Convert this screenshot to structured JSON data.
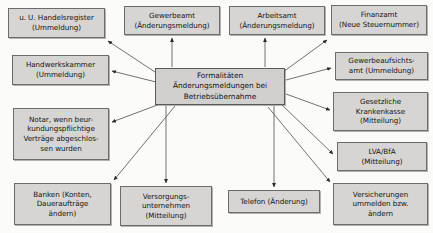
{
  "diagram": {
    "type": "radial-hub-and-spoke",
    "center": {
      "id": "center-hub",
      "name": "center-hub",
      "label": "Formalitäten\nÄnderungsmeldungen bei\nBetriebsübernahme",
      "lines": [
        "Formalitäten",
        "Änderungsmeldungen bei",
        "Betriebsübernahme"
      ],
      "box": {
        "x": 155,
        "y": 68,
        "w": 130,
        "h": 37
      }
    },
    "nodes": [
      {
        "id": "handelsregister",
        "name": "node-handelsregister",
        "lines": [
          "u. U. Handelsregister",
          "(Ummeldung)"
        ],
        "box": {
          "x": 8,
          "y": 8,
          "w": 97,
          "h": 30
        },
        "arrow": {
          "from": [
            158,
            74
          ],
          "to": [
            108,
            41
          ]
        }
      },
      {
        "id": "handwerkskammer",
        "name": "node-handwerkskammer",
        "lines": [
          "Handwerkskammer",
          "(Ummeldung)"
        ],
        "box": {
          "x": 12,
          "y": 55,
          "w": 97,
          "h": 30
        },
        "arrow": {
          "from": [
            156,
            82
          ],
          "to": [
            112,
            71
          ]
        }
      },
      {
        "id": "notar",
        "name": "node-notar",
        "lines": [
          "Notar, wenn beur-",
          "kundungspflichtige",
          "Verträge abgeschlos-",
          "sen wurden"
        ],
        "box": {
          "x": 13,
          "y": 108,
          "w": 96,
          "h": 52
        },
        "arrow": {
          "from": [
            160,
            104
          ],
          "to": [
            112,
            122
          ]
        }
      },
      {
        "id": "banken",
        "name": "node-banken",
        "lines": [
          "Banken (Konten,",
          "Daueraufträge",
          "ändern)"
        ],
        "box": {
          "x": 14,
          "y": 183,
          "w": 97,
          "h": 42
        },
        "arrow": {
          "from": [
            175,
            106
          ],
          "to": [
            114,
            180
          ]
        }
      },
      {
        "id": "gewerbeamt",
        "name": "node-gewerbeamt",
        "lines": [
          "Gewerbeamt",
          "(Änderungsmeldung)"
        ],
        "box": {
          "x": 124,
          "y": 6,
          "w": 96,
          "h": 29
        },
        "arrow": {
          "from": [
            172,
            67
          ],
          "to": [
            172,
            38
          ]
        }
      },
      {
        "id": "arbeitsamt",
        "name": "node-arbeitsamt",
        "lines": [
          "Arbeitsamt",
          "(Änderungsmeldung)"
        ],
        "box": {
          "x": 229,
          "y": 6,
          "w": 96,
          "h": 29
        },
        "arrow": {
          "from": [
            265,
            67
          ],
          "to": [
            265,
            38
          ]
        }
      },
      {
        "id": "finanzamt",
        "name": "node-finanzamt",
        "lines": [
          "Finanzamt",
          "(Neue Steuernummer)"
        ],
        "box": {
          "x": 331,
          "y": 5,
          "w": 96,
          "h": 30
        },
        "arrow": {
          "from": [
            283,
            72
          ],
          "to": [
            327,
            40
          ]
        }
      },
      {
        "id": "gewerbeaufsichtsamt",
        "name": "node-gewerbeaufsichtsamt",
        "lines": [
          "Gewerbeaufsichts-",
          "amt (Ummeldung)"
        ],
        "box": {
          "x": 335,
          "y": 52,
          "w": 93,
          "h": 28
        },
        "arrow": {
          "from": [
            286,
            80
          ],
          "to": [
            331,
            68
          ]
        }
      },
      {
        "id": "krankenkasse",
        "name": "node-krankenkasse",
        "lines": [
          "Gesetzliche",
          "Krankenkasse",
          "(Mitteilung)"
        ],
        "box": {
          "x": 333,
          "y": 92,
          "w": 95,
          "h": 39
        },
        "arrow": {
          "from": [
            286,
            94
          ],
          "to": [
            330,
            110
          ]
        }
      },
      {
        "id": "lva-bfa",
        "name": "node-lva-bfa",
        "lines": [
          "LVA/BfA",
          "(Mitteilung)"
        ],
        "box": {
          "x": 337,
          "y": 142,
          "w": 90,
          "h": 29
        },
        "arrow": {
          "from": [
            282,
            105
          ],
          "to": [
            333,
            154
          ]
        }
      },
      {
        "id": "versicherungen",
        "name": "node-versicherungen",
        "lines": [
          "Versicherungen",
          "ummelden bzw.",
          "ändern"
        ],
        "box": {
          "x": 333,
          "y": 183,
          "w": 95,
          "h": 42
        },
        "arrow": {
          "from": [
            268,
            107
          ],
          "to": [
            330,
            182
          ]
        }
      },
      {
        "id": "versorgungsunternehmen",
        "name": "node-versorgungsunternehmen",
        "lines": [
          "Versorgungs-",
          "unternehmen",
          "(Mitteilung)"
        ],
        "box": {
          "x": 120,
          "y": 186,
          "w": 92,
          "h": 40
        },
        "arrow": {
          "from": [
            166,
            106
          ],
          "to": [
            166,
            183
          ]
        }
      },
      {
        "id": "telefon",
        "name": "node-telefon",
        "lines": [
          "Telefon (Änderung)"
        ],
        "box": {
          "x": 228,
          "y": 190,
          "w": 92,
          "h": 23
        },
        "arrow": {
          "from": [
            274,
            106
          ],
          "to": [
            274,
            187
          ]
        }
      }
    ],
    "style": {
      "node_fill": "#d7d5d3",
      "node_border": "#6e6c6a",
      "arrow_color": "#2b2b2b",
      "background": "#fbfbfa",
      "text_color": "#141414"
    }
  }
}
